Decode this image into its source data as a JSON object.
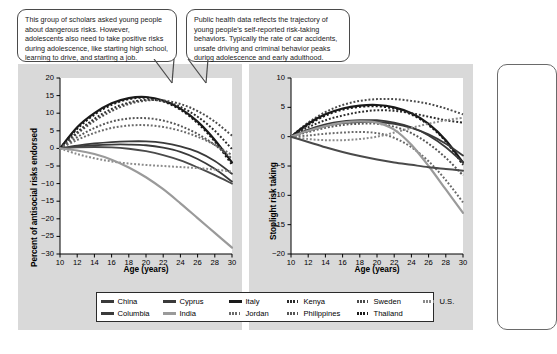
{
  "callouts": [
    {
      "id": "left",
      "text": "This group of scholars asked young people about dangerous risks. However, adolescents also need to take positive risks during adolescence, like starting high school, learning to drive, and starting a job."
    },
    {
      "id": "right",
      "text": "Public health data reflects the trajectory of young people's self-reported risk-taking behaviors. Typically the rate of car accidents, unsafe driving and criminal behavior peaks during adolescence and early adulthood."
    }
  ],
  "legend": {
    "rows": [
      [
        {
          "label": "China",
          "color": "#3a3a3a",
          "style": "solid"
        },
        {
          "label": "Cyprus",
          "color": "#3a3a3a",
          "style": "solid"
        },
        {
          "label": "Italy",
          "color": "#1a1a1a",
          "style": "solid"
        },
        {
          "label": "Kenya",
          "color": "#2b2b2b",
          "style": "dotted"
        },
        {
          "label": "Sweden",
          "color": "#4a4a4a",
          "style": "dotted"
        },
        {
          "label": "U.S.",
          "color": "#8a8a8a",
          "style": "dotted"
        }
      ],
      [
        {
          "label": "Columbia",
          "color": "#3a3a3a",
          "style": "solid"
        },
        {
          "label": "India",
          "color": "#9a9a9a",
          "style": "solid"
        },
        {
          "label": "Jordan",
          "color": "#6a6a6a",
          "style": "dotted"
        },
        {
          "label": "Philippines",
          "color": "#555555",
          "style": "dotted"
        },
        {
          "label": "Thailand",
          "color": "#1a1a1a",
          "style": "dotted"
        }
      ]
    ]
  },
  "chart_data": [
    {
      "id": "antisocial",
      "type": "line",
      "title": "",
      "xlabel": "Age (years)",
      "ylabel": "Percent of antisocial risks endorsed",
      "x": [
        10,
        12,
        14,
        16,
        18,
        20,
        22,
        24,
        26,
        28,
        30
      ],
      "xticks": [
        10,
        12,
        14,
        16,
        18,
        20,
        22,
        24,
        26,
        28,
        30
      ],
      "yticks": [
        20,
        15,
        10,
        5,
        0,
        -5,
        -10,
        -15,
        -20,
        -25,
        -30
      ],
      "xlim": [
        10,
        30
      ],
      "ylim": [
        -30,
        20
      ],
      "grid": false,
      "legend_position": "below",
      "series": [
        {
          "name": "Italy",
          "color": "#1a1a1a",
          "style": "solid",
          "width": 2.2,
          "values": [
            0,
            6.0,
            10.0,
            12.8,
            14.3,
            14.6,
            13.6,
            11.3,
            7.6,
            2.4,
            -4.0
          ]
        },
        {
          "name": "Thailand",
          "color": "#1a1a1a",
          "style": "dotted",
          "width": 2.2,
          "values": [
            0,
            5.6,
            9.6,
            12.4,
            14.0,
            14.4,
            13.4,
            11.0,
            7.2,
            2.0,
            -4.6
          ]
        },
        {
          "name": "Kenya",
          "color": "#2b2b2b",
          "style": "dotted",
          "width": 2.0,
          "values": [
            0,
            4.6,
            8.4,
            11.2,
            13.0,
            13.8,
            13.4,
            11.8,
            9.0,
            5.0,
            -0.2
          ]
        },
        {
          "name": "Sweden",
          "color": "#4a4a4a",
          "style": "dotted",
          "width": 2.0,
          "values": [
            0,
            4.2,
            7.8,
            10.6,
            12.6,
            13.6,
            13.6,
            12.6,
            10.6,
            7.6,
            3.6
          ]
        },
        {
          "name": "Philippines",
          "color": "#555555",
          "style": "dotted",
          "width": 2.0,
          "values": [
            0,
            3.2,
            5.8,
            7.6,
            8.5,
            8.6,
            7.9,
            6.4,
            4.1,
            1.0,
            -2.9
          ]
        },
        {
          "name": "Jordan",
          "color": "#6a6a6a",
          "style": "dotted",
          "width": 2.0,
          "values": [
            0,
            2.4,
            4.4,
            5.8,
            6.5,
            6.6,
            6.1,
            5.0,
            3.3,
            1.0,
            -1.9
          ]
        },
        {
          "name": "Cyprus",
          "color": "#3a3a3a",
          "style": "solid",
          "width": 1.8,
          "values": [
            0,
            0.8,
            1.4,
            1.8,
            2.0,
            2.0,
            1.6,
            0.6,
            -1.0,
            -3.6,
            -7.2
          ]
        },
        {
          "name": "China",
          "color": "#3a3a3a",
          "style": "solid",
          "width": 1.8,
          "values": [
            0,
            0.5,
            0.9,
            1.1,
            1.1,
            0.9,
            0.2,
            -1.0,
            -3.0,
            -5.8,
            -9.4
          ]
        },
        {
          "name": "Columbia",
          "color": "#4a4a4a",
          "style": "solid",
          "width": 1.8,
          "values": [
            0,
            0.3,
            0.4,
            0.3,
            -0.1,
            -0.8,
            -1.9,
            -3.4,
            -5.4,
            -7.6,
            -10.0
          ]
        },
        {
          "name": "U.S.",
          "color": "#8a8a8a",
          "style": "dotted",
          "width": 2.0,
          "values": [
            0,
            -1.6,
            -2.8,
            -3.7,
            -4.3,
            -4.7,
            -5.0,
            -5.3,
            -5.6,
            -6.0,
            -6.6
          ]
        },
        {
          "name": "India",
          "color": "#9a9a9a",
          "style": "solid",
          "width": 2.2,
          "values": [
            0,
            -0.6,
            -1.6,
            -3.2,
            -5.4,
            -8.2,
            -11.6,
            -15.6,
            -19.8,
            -24.0,
            -28.2
          ]
        }
      ]
    },
    {
      "id": "stoplight",
      "type": "line",
      "title": "",
      "xlabel": "Age (years)",
      "ylabel": "Stoplight risk taking",
      "x": [
        10,
        12,
        14,
        16,
        18,
        20,
        22,
        24,
        26,
        28,
        30
      ],
      "xticks": [
        10,
        12,
        14,
        16,
        18,
        20,
        22,
        24,
        26,
        28,
        30
      ],
      "yticks": [
        10,
        5,
        0,
        -5,
        -10,
        -15,
        -20
      ],
      "xlim": [
        10,
        30
      ],
      "ylim": [
        -20,
        10
      ],
      "grid": false,
      "legend_position": "below",
      "series": [
        {
          "name": "Sweden",
          "color": "#4a4a4a",
          "style": "dotted",
          "width": 2.0,
          "values": [
            0,
            2.4,
            4.2,
            5.4,
            6.1,
            6.4,
            6.4,
            6.1,
            5.6,
            4.8,
            3.8
          ]
        },
        {
          "name": "Italy",
          "color": "#1a1a1a",
          "style": "solid",
          "width": 2.2,
          "values": [
            0,
            2.2,
            3.8,
            4.8,
            5.3,
            5.4,
            5.0,
            4.0,
            2.2,
            -0.6,
            -4.4
          ]
        },
        {
          "name": "Thailand",
          "color": "#1a1a1a",
          "style": "dotted",
          "width": 2.2,
          "values": [
            0,
            2.0,
            3.6,
            4.6,
            5.1,
            5.2,
            4.8,
            3.8,
            2.0,
            -0.8,
            -4.8
          ]
        },
        {
          "name": "Kenya",
          "color": "#2b2b2b",
          "style": "dotted",
          "width": 2.0,
          "values": [
            0,
            1.6,
            2.8,
            3.6,
            4.2,
            4.5,
            4.4,
            4.0,
            3.4,
            2.8,
            2.4
          ]
        },
        {
          "name": "Cyprus",
          "color": "#3a3a3a",
          "style": "solid",
          "width": 1.8,
          "values": [
            0,
            1.2,
            2.1,
            2.6,
            2.8,
            2.8,
            2.4,
            1.6,
            0.2,
            -1.8,
            -4.4
          ]
        },
        {
          "name": "China",
          "color": "#3a3a3a",
          "style": "solid",
          "width": 1.8,
          "values": [
            0,
            1.0,
            1.8,
            2.3,
            2.5,
            2.5,
            2.2,
            1.5,
            0.4,
            -1.2,
            -3.2
          ]
        },
        {
          "name": "Philippines",
          "color": "#555555",
          "style": "dotted",
          "width": 2.0,
          "values": [
            0,
            0.8,
            1.5,
            2.0,
            2.2,
            2.2,
            1.7,
            0.6,
            -1.2,
            -3.6,
            -6.6
          ]
        },
        {
          "name": "Jordan",
          "color": "#6a6a6a",
          "style": "dotted",
          "width": 2.0,
          "values": [
            0,
            0.2,
            0.5,
            0.7,
            0.8,
            0.6,
            -0.2,
            -1.8,
            -4.2,
            -7.4,
            -11.2
          ]
        },
        {
          "name": "U.S.",
          "color": "#8a8a8a",
          "style": "dotted",
          "width": 2.0,
          "values": [
            0,
            -0.4,
            -0.6,
            -0.6,
            -0.4,
            0.0,
            0.7,
            1.5,
            2.2,
            2.8,
            3.2
          ]
        },
        {
          "name": "India",
          "color": "#9a9a9a",
          "style": "solid",
          "width": 2.2,
          "values": [
            0,
            1.0,
            1.8,
            2.4,
            2.6,
            2.4,
            1.2,
            -1.4,
            -5.0,
            -9.0,
            -13.0
          ]
        },
        {
          "name": "Columbia",
          "color": "#4a4a4a",
          "style": "solid",
          "width": 2.0,
          "values": [
            0,
            -0.9,
            -1.8,
            -2.6,
            -3.3,
            -3.9,
            -4.4,
            -4.8,
            -5.2,
            -5.5,
            -5.8
          ]
        }
      ]
    }
  ]
}
